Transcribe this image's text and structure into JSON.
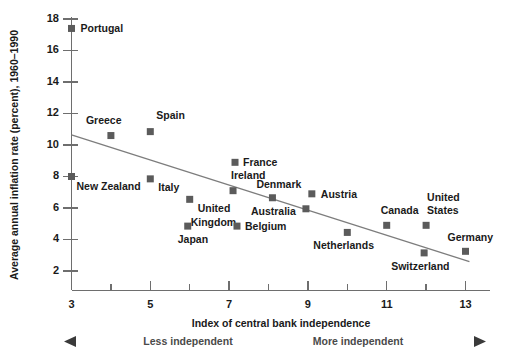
{
  "chart_data": {
    "type": "scatter",
    "title": "",
    "xlabel": "Index of central bank independence",
    "ylabel": "Average annual inflation rate (percent), 1960–1990",
    "xlim": [
      3,
      13.3
    ],
    "ylim": [
      1.4,
      18.3
    ],
    "xticks": [
      3,
      4,
      5,
      6,
      7,
      8,
      9,
      10,
      11,
      12,
      13
    ],
    "xticklabels": [
      "3",
      "",
      "5",
      "",
      "7",
      "",
      "9",
      "",
      "11",
      "",
      "13"
    ],
    "yticks": [
      2,
      4,
      6,
      8,
      10,
      12,
      14,
      16,
      18
    ],
    "yticklabels": [
      "2",
      "4",
      "6",
      "8",
      "10",
      "12",
      "14",
      "16",
      "18"
    ],
    "grid": false,
    "legend": false,
    "points": [
      {
        "label": "Portugal",
        "x": 3.0,
        "y": 17.4,
        "label_dx": 9,
        "label_dy": 1
      },
      {
        "label": "Greece",
        "x": 4.0,
        "y": 10.6,
        "label_dx": -25,
        "label_dy": -14
      },
      {
        "label": "Spain",
        "x": 5.0,
        "y": 10.85,
        "label_dx": 6,
        "label_dy": -15
      },
      {
        "label": "New Zealand",
        "x": 3.0,
        "y": 8.0,
        "label_dx": 5,
        "label_dy": 11
      },
      {
        "label": "Italy",
        "x": 5.0,
        "y": 7.85,
        "label_dx": 8,
        "label_dy": 9
      },
      {
        "label": "France",
        "x": 7.15,
        "y": 8.9,
        "label_dx": 8,
        "label_dy": 1
      },
      {
        "label": "Ireland",
        "x": 7.1,
        "y": 7.1,
        "label_dx": -2,
        "label_dy": -14
      },
      {
        "label": "Denmark",
        "x": 8.1,
        "y": 6.65,
        "label_dx": -16,
        "label_dy": -13
      },
      {
        "label": "Austria",
        "x": 9.1,
        "y": 6.9,
        "label_dx": 9,
        "label_dy": 1
      },
      {
        "label": "United",
        "x": 6.0,
        "y": 6.55,
        "label_dx": 8,
        "label_dy": 10
      },
      {
        "label": "Kingdom",
        "x": 6.0,
        "y": 6.55,
        "label_dx": 1,
        "label_dy": 24
      },
      {
        "label": "Australia",
        "x": 8.95,
        "y": 5.95,
        "label_dx": -55,
        "label_dy": 3
      },
      {
        "label": "Japan",
        "x": 5.95,
        "y": 4.85,
        "label_dx": -10,
        "label_dy": 14
      },
      {
        "label": "Belgium",
        "x": 7.2,
        "y": 4.85,
        "label_dx": 8,
        "label_dy": 1
      },
      {
        "label": "Netherlands",
        "x": 10.0,
        "y": 4.45,
        "label_dx": -34,
        "label_dy": 14
      },
      {
        "label": "Canada",
        "x": 11.0,
        "y": 4.9,
        "label_dx": -6,
        "label_dy": -14
      },
      {
        "label": "United",
        "x": 12.0,
        "y": 4.9,
        "label_dx": 1,
        "label_dy": -27
      },
      {
        "label": "States",
        "x": 12.0,
        "y": 4.9,
        "label_dx": 1,
        "label_dy": -14
      },
      {
        "label": "Switzerland",
        "x": 11.95,
        "y": 3.15,
        "label_dx": -33,
        "label_dy": 14
      },
      {
        "label": "Germany",
        "x": 13.0,
        "y": 3.25,
        "label_dx": -18,
        "label_dy": -13
      }
    ],
    "trendline": {
      "x0": 3.0,
      "y0": 10.65,
      "x1": 13.1,
      "y1": 2.6
    },
    "annotations": {
      "left_note": "Less independent",
      "right_note": "More independent"
    }
  },
  "axis": {
    "x_title": "Index of central bank independence",
    "y_title": "Average annual inflation rate (percent), 1960–1990"
  },
  "ticks": {
    "x": [
      "3",
      "5",
      "7",
      "9",
      "11",
      "13"
    ],
    "y": [
      "18",
      "16",
      "14",
      "12",
      "10",
      "8",
      "6",
      "4",
      "2"
    ]
  },
  "notes": {
    "less": "Less independent",
    "more": "More independent"
  }
}
